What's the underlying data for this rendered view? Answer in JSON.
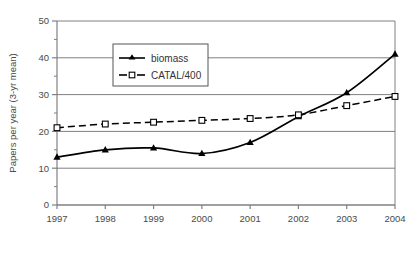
{
  "chart_data": {
    "type": "line",
    "title": "",
    "xlabel": "",
    "ylabel": "Papers per year (3-yr mean)",
    "categories": [
      "1997",
      "1998",
      "1999",
      "2000",
      "2001",
      "2002",
      "2003",
      "2004"
    ],
    "x": [
      1997,
      1998,
      1999,
      2000,
      2001,
      2002,
      2003,
      2004
    ],
    "xlim": [
      1997,
      2004
    ],
    "ylim": [
      0,
      50
    ],
    "yticks": [
      0,
      10,
      20,
      30,
      40,
      50
    ],
    "ytick_labels": [
      "0",
      "10",
      "20",
      "30",
      "40",
      "50"
    ],
    "yminor_step": 5,
    "grid": "horizontal",
    "legend_position": "upper-center-left",
    "series": [
      {
        "name": "biomass",
        "marker": "filled-triangle",
        "line_style": "solid",
        "color": "#000000",
        "values": [
          13,
          15,
          15.5,
          14,
          17,
          24,
          30.5,
          41
        ]
      },
      {
        "name": "CATAL/400",
        "marker": "open-square",
        "line_style": "dashed",
        "color": "#000000",
        "values": [
          21,
          22,
          22.5,
          23,
          23.5,
          24.5,
          27,
          29.5
        ]
      }
    ]
  },
  "legend": {
    "entries": [
      {
        "label": "biomass"
      },
      {
        "label": "CATAL/400"
      }
    ]
  },
  "colors": {
    "axis": "#808080",
    "grid": "#808080",
    "series": "#000000",
    "text": "#4a4a4a",
    "background": "#ffffff"
  }
}
